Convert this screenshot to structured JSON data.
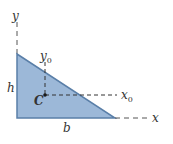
{
  "figure": {
    "shape": "right-triangle",
    "colors": {
      "fill": "#9cb8d8",
      "edge": "#5a7fa8",
      "axis": "#555555",
      "text": "#333333",
      "centroid": "#1a1a1a"
    },
    "labels": {
      "y_axis": "y",
      "x_axis": "x",
      "y0_axis": "y",
      "y0_sub": "0",
      "x0_axis": "x",
      "x0_sub": "0",
      "height": "h",
      "base": "b",
      "centroid": "C"
    }
  }
}
